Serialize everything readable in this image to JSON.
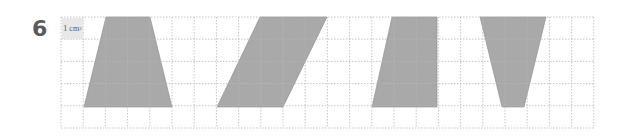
{
  "question": {
    "number": "6"
  },
  "unit_label": {
    "text": "1 cm",
    "sup": "2"
  },
  "grid": {
    "x0": 61,
    "y0": 17,
    "cell": 22.2,
    "cols": 24,
    "rows": 5,
    "line_color": "#b8b8b8"
  },
  "shape_fill": "#a9a9a9",
  "shapes": [
    {
      "name": "trapezoid",
      "points": "106,17 150,17 172,107 84,107"
    },
    {
      "name": "parallelogram",
      "points": "260,17 327,17 283,107 217,107"
    },
    {
      "name": "rectangle-trapezoid",
      "points": "392,17 437,17 437,107 372,107"
    },
    {
      "name": "inverted-trapezoid",
      "points": "480,17 546,17 524,107 502,107"
    }
  ]
}
